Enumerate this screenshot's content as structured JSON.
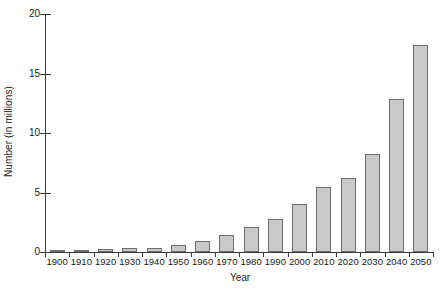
{
  "chart_data": {
    "type": "bar",
    "title": "",
    "xlabel": "Year",
    "ylabel": "Number (in millions)",
    "categories": [
      "1900",
      "1910",
      "1920",
      "1930",
      "1940",
      "1950",
      "1960",
      "1970",
      "1980",
      "1990",
      "2000",
      "2010",
      "2020",
      "2030",
      "2040",
      "2050"
    ],
    "values": [
      0.12,
      0.2,
      0.25,
      0.3,
      0.37,
      0.58,
      0.9,
      1.4,
      2.1,
      2.8,
      4.0,
      5.5,
      6.2,
      8.2,
      12.9,
      17.4
    ],
    "ylim": [
      0,
      20
    ],
    "yticks": [
      0,
      5,
      10,
      15,
      20
    ],
    "ytick_labels": [
      "0",
      "5",
      "10",
      "15",
      "20"
    ],
    "grid": false,
    "legend": null,
    "bar_fill_color": "#c9c9c9",
    "bar_border_color": "#6e6e6e",
    "axis_color": "#3a3a3a"
  }
}
